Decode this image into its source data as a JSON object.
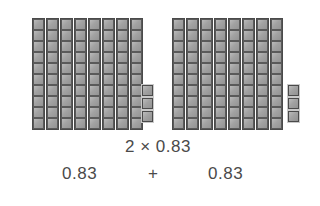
{
  "figure": {
    "type": "base-ten-blocks-multiplication",
    "groups": [
      {
        "name": "left-group",
        "rods": 8,
        "cells_per_rod": 10,
        "loose_units": 3,
        "value": "0.83"
      },
      {
        "name": "right-group",
        "rods": 8,
        "cells_per_rod": 10,
        "loose_units": 3,
        "value": "0.83"
      }
    ],
    "block_fill_color": "#9d9d9d",
    "block_border_color": "#4a4a4a",
    "text_color": "#4a4a4a",
    "background_color": "#ffffff"
  },
  "equation": {
    "product_line": "2 × 0.83",
    "multiplier": "2",
    "times_symbol": "×",
    "multiplicand": "0.83",
    "sum_left_term": "0.83",
    "plus_symbol": "+",
    "sum_right_term": "0.83"
  }
}
